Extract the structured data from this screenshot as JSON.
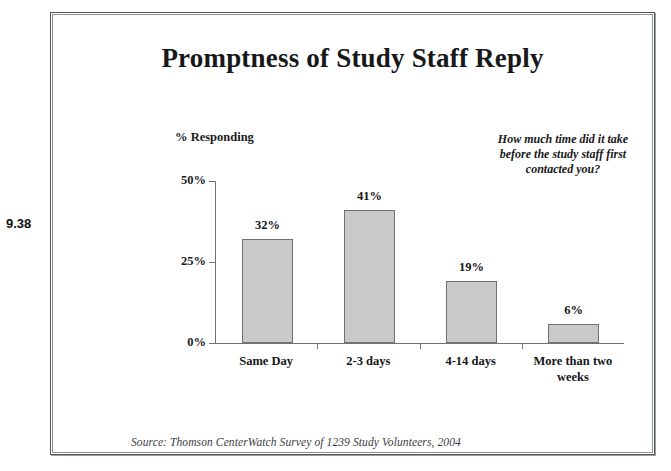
{
  "figure": {
    "number": "9.38"
  },
  "chart_data": {
    "type": "bar",
    "title": "Promptness of Study Staff Reply",
    "xlabel": "",
    "ylabel": "% Responding",
    "categories": [
      "Same Day",
      "2-3 days",
      "4-14 days",
      "More than two weeks"
    ],
    "values": [
      32,
      41,
      19,
      6
    ],
    "value_labels": [
      "32%",
      "41%",
      "19%",
      "6%"
    ],
    "ylim": [
      0,
      50
    ],
    "yticks": [
      0,
      25,
      50
    ],
    "ytick_labels": [
      "0%",
      "25%",
      "50%"
    ],
    "grid": false,
    "legend": "none",
    "annotation": {
      "line1": "How much time did it take",
      "line2": "before the study staff first",
      "line3": "contacted you?"
    },
    "source": "Source: Thomson CenterWatch Survey of 1239 Study Volunteers, 2004",
    "colors": {
      "bar_fill": "#c9c9c9",
      "bar_outline": "#6d7074",
      "axis": "#6f7276",
      "text": "#151618",
      "frame": "#55585c"
    }
  }
}
